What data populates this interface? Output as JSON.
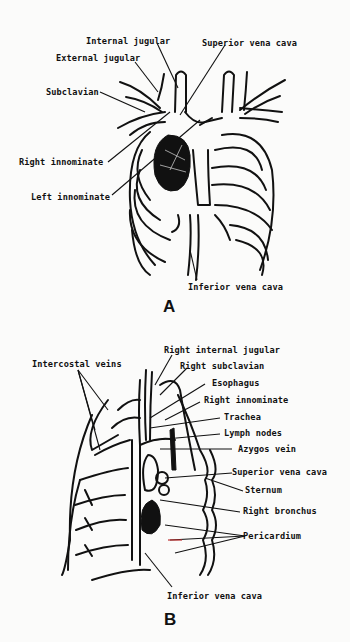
{
  "figure_a": {
    "panel_label": "A",
    "labels": {
      "internal_jugular": "Internal jugular",
      "superior_vena_cava": "Superior vena cava",
      "external_jugular": "External jugular",
      "subclavian": "Subclavian",
      "right_innominate": "Right innominate",
      "left_innominate": "Left innominate",
      "inferior_vena_cava": "Inferior vena cava"
    }
  },
  "figure_b": {
    "panel_label": "B",
    "labels": {
      "intercostal_veins": "Intercostal veins",
      "right_internal_jugular": "Right internal jugular",
      "right_subclavian": "Right subclavian",
      "esophagus": "Esophagus",
      "right_innominate": "Right innominate",
      "trachea": "Trachea",
      "lymph_nodes": "Lymph nodes",
      "azygos_vein": "Azygos vein",
      "superior_vena_cava": "Superior vena cava",
      "sternum": "Sternum",
      "right_bronchus": "Right bronchus",
      "pericardium": "Pericardium",
      "inferior_vena_cava": "Inferior vena cava"
    }
  }
}
